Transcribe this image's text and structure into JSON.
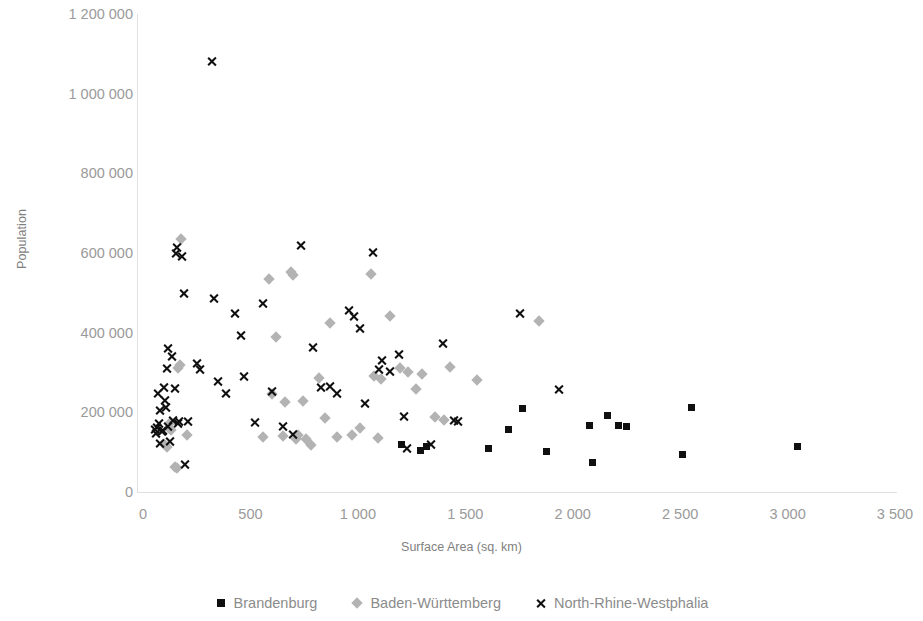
{
  "chart_data": {
    "type": "scatter",
    "title": "",
    "xlabel": "Surface Area (sq. km)",
    "ylabel": "Population",
    "xlim": [
      0,
      3500
    ],
    "ylim": [
      0,
      1200000
    ],
    "xticks": [
      0,
      500,
      1000,
      1500,
      2000,
      2500,
      3000,
      3500
    ],
    "xtick_labels": [
      "0",
      "500",
      "1 000",
      "1 500",
      "2 000",
      "2 500",
      "3 000",
      "3 500"
    ],
    "yticks": [
      0,
      200000,
      400000,
      600000,
      800000,
      1000000,
      1200000
    ],
    "ytick_labels": [
      "0",
      "200 000",
      "400 000",
      "600 000",
      "800 000",
      "1 000 000",
      "1 200 000"
    ],
    "grid": false,
    "legend_position": "bottom",
    "series": [
      {
        "name": "Brandenburg",
        "marker": "square",
        "color": "#101010",
        "points": [
          [
            1610,
            110000
          ],
          [
            1700,
            158000
          ],
          [
            1765,
            210000
          ],
          [
            1880,
            102000
          ],
          [
            2090,
            75000
          ],
          [
            2080,
            168000
          ],
          [
            2160,
            193000
          ],
          [
            2215,
            168000
          ],
          [
            2250,
            165000
          ],
          [
            2510,
            95000
          ],
          [
            2555,
            212000
          ],
          [
            3045,
            115000
          ],
          [
            1290,
            104000
          ],
          [
            1320,
            115000
          ],
          [
            1205,
            118000
          ]
        ]
      },
      {
        "name": "Baden-Württemberg",
        "marker": "diamond",
        "color": "#b3b3b3",
        "points": [
          [
            100,
            120000
          ],
          [
            110,
            112000
          ],
          [
            120,
            160000
          ],
          [
            125,
            172000
          ],
          [
            130,
            155000
          ],
          [
            150,
            63000
          ],
          [
            160,
            60000
          ],
          [
            165,
            311000
          ],
          [
            170,
            318000
          ],
          [
            175,
            635000
          ],
          [
            205,
            144000
          ],
          [
            560,
            137000
          ],
          [
            585,
            535000
          ],
          [
            600,
            247000
          ],
          [
            620,
            390000
          ],
          [
            650,
            140000
          ],
          [
            660,
            225000
          ],
          [
            690,
            552000
          ],
          [
            700,
            545000
          ],
          [
            710,
            133000
          ],
          [
            720,
            143000
          ],
          [
            745,
            228000
          ],
          [
            760,
            132000
          ],
          [
            780,
            118000
          ],
          [
            820,
            287000
          ],
          [
            845,
            185000
          ],
          [
            870,
            425000
          ],
          [
            905,
            138000
          ],
          [
            975,
            142000
          ],
          [
            1010,
            160000
          ],
          [
            1060,
            548000
          ],
          [
            1075,
            290000
          ],
          [
            1095,
            135000
          ],
          [
            1110,
            283000
          ],
          [
            1150,
            442000
          ],
          [
            1195,
            312000
          ],
          [
            1235,
            302000
          ],
          [
            1270,
            258000
          ],
          [
            1300,
            297000
          ],
          [
            1360,
            188000
          ],
          [
            1400,
            182000
          ],
          [
            1430,
            313000
          ],
          [
            1555,
            282000
          ],
          [
            1845,
            430000
          ]
        ]
      },
      {
        "name": "North-Rhine-Westphalia",
        "marker": "cross",
        "color": "#101010",
        "points": [
          [
            55,
            158000
          ],
          [
            60,
            148000
          ],
          [
            68,
            163000
          ],
          [
            70,
            248000
          ],
          [
            75,
            173000
          ],
          [
            80,
            122000
          ],
          [
            82,
            205000
          ],
          [
            88,
            152000
          ],
          [
            95,
            155000
          ],
          [
            100,
            262000
          ],
          [
            105,
            230000
          ],
          [
            110,
            212000
          ],
          [
            112,
            310000
          ],
          [
            115,
            360000
          ],
          [
            118,
            165000
          ],
          [
            125,
            128000
          ],
          [
            135,
            340000
          ],
          [
            140,
            180000
          ],
          [
            148,
            260000
          ],
          [
            155,
            600000
          ],
          [
            160,
            615000
          ],
          [
            165,
            172000
          ],
          [
            170,
            178000
          ],
          [
            182,
            590000
          ],
          [
            190,
            498000
          ],
          [
            195,
            70000
          ],
          [
            210,
            178000
          ],
          [
            250,
            322000
          ],
          [
            265,
            308000
          ],
          [
            320,
            1080000
          ],
          [
            330,
            485000
          ],
          [
            350,
            277000
          ],
          [
            385,
            248000
          ],
          [
            430,
            448000
          ],
          [
            455,
            392000
          ],
          [
            470,
            290000
          ],
          [
            520,
            175000
          ],
          [
            560,
            472000
          ],
          [
            600,
            252000
          ],
          [
            650,
            165000
          ],
          [
            700,
            145000
          ],
          [
            735,
            620000
          ],
          [
            790,
            362000
          ],
          [
            830,
            263000
          ],
          [
            870,
            265000
          ],
          [
            905,
            248000
          ],
          [
            960,
            455000
          ],
          [
            985,
            440000
          ],
          [
            1010,
            410000
          ],
          [
            1035,
            222000
          ],
          [
            1070,
            602000
          ],
          [
            1100,
            308000
          ],
          [
            1115,
            330000
          ],
          [
            1150,
            302000
          ],
          [
            1190,
            345000
          ],
          [
            1215,
            190000
          ],
          [
            1230,
            108000
          ],
          [
            1340,
            120000
          ],
          [
            1395,
            372000
          ],
          [
            1450,
            180000
          ],
          [
            1465,
            178000
          ],
          [
            1755,
            447000
          ],
          [
            1935,
            257000
          ]
        ]
      }
    ]
  },
  "legend": {
    "items": [
      {
        "label": "Brandenburg",
        "marker": "square-marker"
      },
      {
        "label": "Baden-Württemberg",
        "marker": "diamond-marker"
      },
      {
        "label": "North-Rhine-Westphalia",
        "marker": "cross-marker"
      }
    ]
  },
  "geometry": {
    "plot_left": 143,
    "plot_right": 895,
    "plot_top": 14,
    "plot_bottom": 492
  }
}
